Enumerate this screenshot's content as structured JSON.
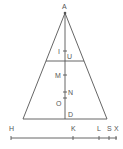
{
  "diagram": {
    "colors": {
      "line": "#555555",
      "background": "#ffffff"
    },
    "triangle": {
      "apex_label": "A",
      "axis_points": [
        {
          "label": "I",
          "side": "left"
        },
        {
          "label": "U",
          "side": "right"
        },
        {
          "label": "M",
          "side": "left"
        },
        {
          "label": "N",
          "side": "right"
        },
        {
          "label": "O",
          "side": "left"
        },
        {
          "label": "D",
          "side": "right"
        }
      ]
    },
    "number_line": {
      "points": [
        {
          "label": "H"
        },
        {
          "label": "K"
        },
        {
          "label": "L"
        },
        {
          "label": "S"
        },
        {
          "label": "X"
        }
      ]
    }
  }
}
